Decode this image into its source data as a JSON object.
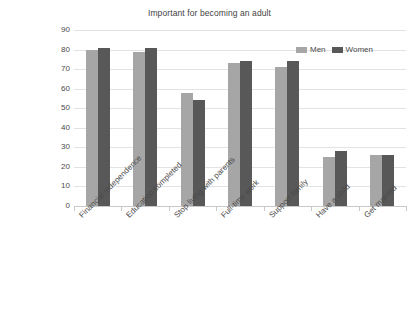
{
  "chart_data": {
    "type": "bar",
    "title": "Important for becoming an adult",
    "xlabel": "",
    "ylabel": "",
    "ylim": [
      0,
      90
    ],
    "ytick_values": [
      90,
      80,
      70,
      60,
      50,
      40,
      30,
      20,
      10,
      0
    ],
    "ytick_labels": [
      "90",
      "80",
      "70",
      "60",
      "50",
      "40",
      "30",
      "20",
      "10",
      "0"
    ],
    "grid": true,
    "legend_position": "top-right",
    "categories": [
      "Financial independence",
      "Education completed",
      "Stop living with parents",
      "Full-time work",
      "Support family",
      "Have a child",
      "Get married"
    ],
    "series": [
      {
        "name": "Men",
        "color": "#a6a6a6",
        "values": [
          80,
          79,
          58,
          73,
          71,
          25,
          26
        ]
      },
      {
        "name": "Women",
        "color": "#585858",
        "values": [
          81,
          81,
          54,
          74,
          74,
          28,
          26
        ]
      }
    ]
  },
  "legend": {
    "entries": [
      {
        "label": "Men",
        "color": "#a6a6a6"
      },
      {
        "label": "Women",
        "color": "#585858"
      }
    ]
  },
  "colors": {
    "men": "#a6a6a6",
    "women": "#585858",
    "gridline": "#e3e3e3",
    "axis": "#c9c9c9",
    "text": "#4a4a4a",
    "background": "#ffffff"
  }
}
